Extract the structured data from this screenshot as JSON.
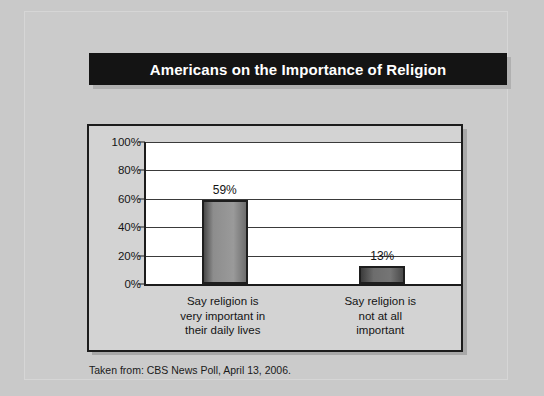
{
  "slide": {
    "title": "Americans on the Importance of Religion",
    "source_note": "Taken from: CBS News Poll, April 13, 2006.",
    "colors": {
      "background": "#c9c9c9",
      "title_bar": "#141414",
      "title_text": "#ffffff",
      "plot_background": "#ffffff",
      "bar_fill": "#8d8d8d",
      "bar_border": "#1e1e1e",
      "axis": "#1c1c1c"
    }
  },
  "chart_data": {
    "type": "bar",
    "title": "Americans on the Importance of Religion",
    "xlabel": "",
    "ylabel": "",
    "categories": [
      "Say religion is\nvery important in\ntheir daily lives",
      "Say religion is\nnot at all\nimportant"
    ],
    "values": [
      59,
      13
    ],
    "value_labels": [
      "59%",
      "13%"
    ],
    "ylim": [
      0,
      100
    ],
    "yticks": [
      0,
      20,
      40,
      60,
      80,
      100
    ],
    "ytick_labels": [
      "0%",
      "20%",
      "40%",
      "60%",
      "80%",
      "100%"
    ],
    "grid": true,
    "grid_axis": "y",
    "legend": false,
    "legend_position": "none",
    "annotation": "Taken from: CBS News Poll, April 13, 2006."
  }
}
